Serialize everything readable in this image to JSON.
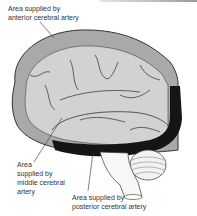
{
  "figure": {
    "labels": [
      {
        "id": "anterior",
        "text": "Area supplied by\nanterior cerebral artery"
      },
      {
        "id": "middle",
        "text": "Area\nsupplied by\nmiddle cerebral\nartery"
      },
      {
        "id": "posterior",
        "text": "Area supplied by\nposterior cerebral artery"
      }
    ],
    "colors": {
      "anterior_territory": "#a9a9a9",
      "middle_territory": "#d2d2d2",
      "posterior_territory": "#151515",
      "outline": "#333333",
      "cerebellum": "#f2f2f2"
    }
  }
}
